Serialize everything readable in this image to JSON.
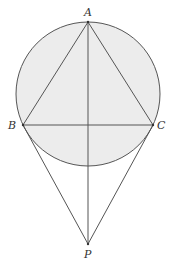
{
  "diagram": {
    "type": "geometry",
    "colors": {
      "circle_fill": "#ececec",
      "stroke": "#555555",
      "label": "#333333"
    },
    "circle": {
      "cx": 88,
      "cy": 94,
      "r": 72
    },
    "points": {
      "A": {
        "label": "A",
        "x": 88,
        "y": 22
      },
      "B": {
        "label": "B",
        "x": 23,
        "y": 125
      },
      "C": {
        "label": "C",
        "x": 153,
        "y": 125
      },
      "P": {
        "label": "P",
        "x": 88,
        "y": 244
      }
    },
    "segments": [
      [
        "A",
        "B"
      ],
      [
        "A",
        "C"
      ],
      [
        "B",
        "C"
      ],
      [
        "A",
        "P"
      ],
      [
        "B",
        "P"
      ],
      [
        "C",
        "P"
      ]
    ]
  }
}
